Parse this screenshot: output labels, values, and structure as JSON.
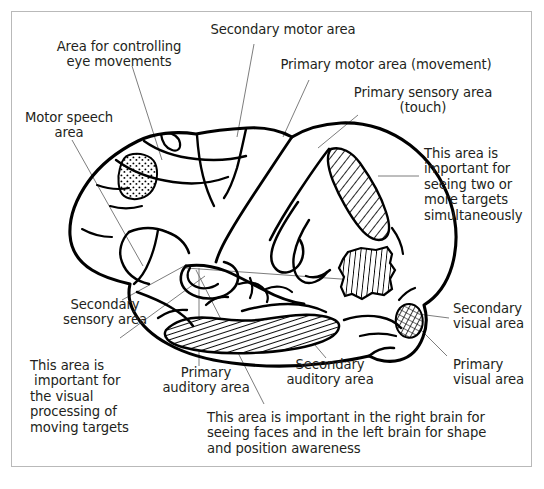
{
  "figure": {
    "background_color": "#ffffff",
    "border_color": "#b9b9b9",
    "ink_color": "#000000",
    "leader_line_color": "#6e6e6e",
    "width": 544,
    "height": 489
  },
  "labels": {
    "eye_movements": "Area for controlling\neye movements",
    "motor_speech": "Motor speech\narea",
    "secondary_motor": "Secondary motor area",
    "primary_motor": "Primary motor area (movement)",
    "primary_sensory": "Primary sensory area\n(touch)",
    "two_targets": "This area is\nimportant for\nseeing two or\nmore targets\nsimultaneously",
    "secondary_visual": "Secondary\nvisual area",
    "primary_visual": "Primary\nvisual area",
    "secondary_sensory": "Secondary\nsensory area",
    "moving_targets": "This area is\n important for\nthe visual\nprocessing of\nmoving targets",
    "primary_auditory": "Primary\nauditory area",
    "secondary_auditory": "Secondary\nauditory area",
    "faces_shape": "This area is important in the right brain for\nseeing faces and in the left brain for shape\nand position awareness"
  },
  "regions": [
    {
      "id": "motor-speech-region",
      "label_key": "motor_speech",
      "fill_pattern": "stipple",
      "description": "Broca's area, small stippled patch on inferior frontal gyrus"
    },
    {
      "id": "primary-sensory-region",
      "label_key": "primary_sensory",
      "fill_pattern": "diagonal-hatch",
      "description": "Elongated band along the postcentral gyrus"
    },
    {
      "id": "two-targets-region",
      "label_key": "two_targets",
      "fill_pattern": "vertical-hatch",
      "description": "Irregular parietal patch"
    },
    {
      "id": "auditory-band-region",
      "label_key": "primary_auditory",
      "fill_pattern": "dense-diagonal-hatch",
      "description": "Long band along superior temporal gyrus"
    },
    {
      "id": "visual-region",
      "label_key": "primary_visual",
      "fill_pattern": "crosshatch",
      "description": "Small occipital pole lens shape"
    }
  ]
}
